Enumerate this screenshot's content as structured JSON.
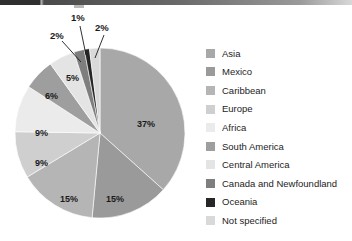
{
  "chart_data": {
    "type": "pie",
    "title": "",
    "subtitle": "",
    "xlabel": "",
    "ylabel": "",
    "legend_position": "right",
    "grid": false,
    "unit": "%",
    "start_angle_deg": 0,
    "direction": "clockwise",
    "categories": [
      "Asia",
      "Mexico",
      "Caribbean",
      "Europe",
      "Africa",
      "South America",
      "Central America",
      "Canada and Newfoundland",
      "Oceania",
      "Not specified"
    ],
    "values": [
      37,
      15,
      15,
      9,
      9,
      6,
      5,
      2,
      1,
      2
    ],
    "labels": [
      "37%",
      "15%",
      "15%",
      "9%",
      "9%",
      "6%",
      "5%",
      "2%",
      "1%",
      "2%"
    ],
    "colors": [
      "#a8a8a8",
      "#9a9a9a",
      "#b5b5b5",
      "#cfcfcf",
      "#ebebeb",
      "#9e9e9e",
      "#e4e4e4",
      "#7e7e7e",
      "#262626",
      "#d9d9d9"
    ],
    "slices": [
      {
        "label": "Asia",
        "value": 37,
        "display": "37%",
        "color": "#a8a8a8",
        "callout": false
      },
      {
        "label": "Mexico",
        "value": 15,
        "display": "15%",
        "color": "#9a9a9a",
        "callout": false
      },
      {
        "label": "Caribbean",
        "value": 15,
        "display": "15%",
        "color": "#b5b5b5",
        "callout": false
      },
      {
        "label": "Europe",
        "value": 9,
        "display": "9%",
        "color": "#cfcfcf",
        "callout": false
      },
      {
        "label": "Africa",
        "value": 9,
        "display": "9%",
        "color": "#ebebeb",
        "callout": false
      },
      {
        "label": "South America",
        "value": 6,
        "display": "6%",
        "color": "#9e9e9e",
        "callout": false
      },
      {
        "label": "Central America",
        "value": 5,
        "display": "5%",
        "color": "#e4e4e4",
        "callout": false
      },
      {
        "label": "Canada and Newfoundland",
        "value": 2,
        "display": "2%",
        "color": "#7e7e7e",
        "callout": true
      },
      {
        "label": "Oceania",
        "value": 1,
        "display": "1%",
        "color": "#262626",
        "callout": true
      },
      {
        "label": "Not specified",
        "value": 2,
        "display": "2%",
        "color": "#d9d9d9",
        "callout": true
      }
    ]
  },
  "pie_labels": {
    "asia": "37%",
    "mexico": "15%",
    "caribbean": "15%",
    "europe": "9%",
    "africa": "9%",
    "south_america": "6%",
    "central_america": "5%",
    "canada": "2%",
    "oceania": "1%",
    "not_specified": "2%"
  },
  "legend": {
    "items": [
      {
        "label": "Asia",
        "color": "#a8a8a8"
      },
      {
        "label": "Mexico",
        "color": "#9a9a9a"
      },
      {
        "label": "Caribbean",
        "color": "#b5b5b5"
      },
      {
        "label": "Europe",
        "color": "#cfcfcf"
      },
      {
        "label": "Africa",
        "color": "#ebebeb"
      },
      {
        "label": "South America",
        "color": "#9e9e9e"
      },
      {
        "label": "Central America",
        "color": "#e4e4e4"
      },
      {
        "label": "Canada and Newfoundland",
        "color": "#7e7e7e"
      },
      {
        "label": "Oceania",
        "color": "#262626"
      },
      {
        "label": "Not specified",
        "color": "#d9d9d9"
      }
    ]
  }
}
